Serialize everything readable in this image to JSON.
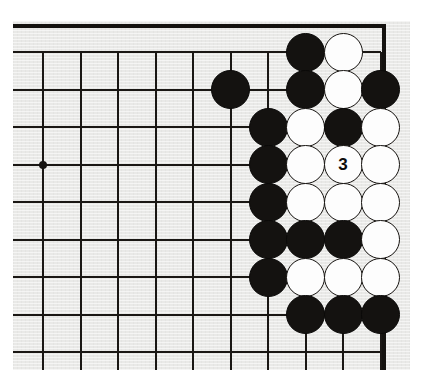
{
  "app": {
    "title": "Go board diagram",
    "type": "go-game-position"
  },
  "board": {
    "background_color": "#e9e9e7",
    "line_color": "#1a1714",
    "black_color": "#141210",
    "white_color": "#fdfdfd",
    "corner": "top-right",
    "visible_columns": 10,
    "visible_rows": 9,
    "grid_spacing_px": 37.5,
    "origin_x_px": 43,
    "origin_y_px": 52,
    "right_edge_column_index": 9,
    "star_points": [
      {
        "col": 0,
        "row": 3,
        "name": "hoshi"
      }
    ]
  },
  "chart_data": {
    "type": "table",
    "stones": [
      {
        "col": 7,
        "row": 0,
        "color": "black",
        "label": ""
      },
      {
        "col": 8,
        "row": 0,
        "color": "white",
        "label": ""
      },
      {
        "col": 5,
        "row": 1,
        "color": "black",
        "label": ""
      },
      {
        "col": 7,
        "row": 1,
        "color": "black",
        "label": ""
      },
      {
        "col": 8,
        "row": 1,
        "color": "white",
        "label": ""
      },
      {
        "col": 9,
        "row": 1,
        "color": "black",
        "label": ""
      },
      {
        "col": 6,
        "row": 2,
        "color": "black",
        "label": ""
      },
      {
        "col": 7,
        "row": 2,
        "color": "white",
        "label": ""
      },
      {
        "col": 8,
        "row": 2,
        "color": "black",
        "label": ""
      },
      {
        "col": 9,
        "row": 2,
        "color": "white",
        "label": ""
      },
      {
        "col": 6,
        "row": 3,
        "color": "black",
        "label": ""
      },
      {
        "col": 7,
        "row": 3,
        "color": "white",
        "label": ""
      },
      {
        "col": 8,
        "row": 3,
        "color": "white",
        "label": "3"
      },
      {
        "col": 9,
        "row": 3,
        "color": "white",
        "label": ""
      },
      {
        "col": 6,
        "row": 4,
        "color": "black",
        "label": ""
      },
      {
        "col": 7,
        "row": 4,
        "color": "white",
        "label": ""
      },
      {
        "col": 8,
        "row": 4,
        "color": "white",
        "label": ""
      },
      {
        "col": 9,
        "row": 4,
        "color": "white",
        "label": ""
      },
      {
        "col": 6,
        "row": 5,
        "color": "black",
        "label": ""
      },
      {
        "col": 7,
        "row": 5,
        "color": "black",
        "label": ""
      },
      {
        "col": 8,
        "row": 5,
        "color": "black",
        "label": ""
      },
      {
        "col": 9,
        "row": 5,
        "color": "white",
        "label": ""
      },
      {
        "col": 6,
        "row": 6,
        "color": "black",
        "label": ""
      },
      {
        "col": 7,
        "row": 6,
        "color": "white",
        "label": ""
      },
      {
        "col": 8,
        "row": 6,
        "color": "white",
        "label": ""
      },
      {
        "col": 9,
        "row": 6,
        "color": "white",
        "label": ""
      },
      {
        "col": 7,
        "row": 7,
        "color": "black",
        "label": ""
      },
      {
        "col": 8,
        "row": 7,
        "color": "black",
        "label": ""
      },
      {
        "col": 9,
        "row": 7,
        "color": "black",
        "label": ""
      }
    ],
    "move_labels": [
      {
        "number": "3",
        "col": 8,
        "row": 3,
        "color": "white"
      }
    ]
  }
}
